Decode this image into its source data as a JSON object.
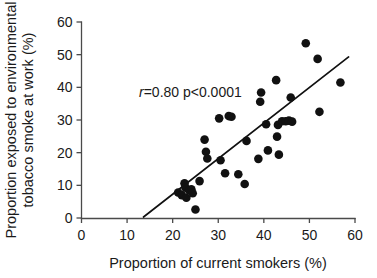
{
  "chart_data": {
    "type": "scatter",
    "title": "",
    "xlabel": "Proportion of current smokers (%)",
    "ylabel_line1": "Proportion exposed to environmental",
    "ylabel_line2": "tobacco smoke at work (%)",
    "xlim": [
      0,
      60
    ],
    "ylim": [
      0,
      60
    ],
    "xticks": [
      0,
      10,
      20,
      30,
      40,
      50,
      60
    ],
    "yticks": [
      0,
      10,
      20,
      30,
      40,
      50,
      60
    ],
    "xtick_labels": [
      "0",
      "10",
      "20",
      "30",
      "40",
      "50",
      "60"
    ],
    "ytick_labels": [
      "0",
      "10",
      "20",
      "30",
      "40",
      "50",
      "60"
    ],
    "grid": false,
    "legend": "none",
    "marker": "filled-circle",
    "marker_color": "#111111",
    "annotation": {
      "statistic_symbol": "r",
      "statistic_text": "=0.80 p<0.0001",
      "full_text": "r=0.80 p<0.0001",
      "x": 22.5,
      "y": 41.5
    },
    "fit_line": {
      "type": "linear-regression",
      "x_start": 13.6,
      "y_start": 0.3,
      "x_end": 58.6,
      "y_end": 49.3,
      "color": "#111111"
    },
    "points": [
      {
        "x": 21.2,
        "y": 7.8
      },
      {
        "x": 22.0,
        "y": 7.0
      },
      {
        "x": 22.6,
        "y": 10.6
      },
      {
        "x": 22.8,
        "y": 9.3
      },
      {
        "x": 23.0,
        "y": 6.2
      },
      {
        "x": 23.6,
        "y": 8.5
      },
      {
        "x": 24.1,
        "y": 8.8
      },
      {
        "x": 24.4,
        "y": 7.6
      },
      {
        "x": 25.0,
        "y": 2.6
      },
      {
        "x": 25.9,
        "y": 11.3
      },
      {
        "x": 27.0,
        "y": 24.0
      },
      {
        "x": 27.3,
        "y": 20.3
      },
      {
        "x": 27.6,
        "y": 18.2
      },
      {
        "x": 30.2,
        "y": 30.5
      },
      {
        "x": 30.5,
        "y": 17.7
      },
      {
        "x": 31.5,
        "y": 13.7
      },
      {
        "x": 32.3,
        "y": 31.2
      },
      {
        "x": 32.9,
        "y": 31.0
      },
      {
        "x": 34.4,
        "y": 13.4
      },
      {
        "x": 35.8,
        "y": 10.4
      },
      {
        "x": 36.2,
        "y": 23.6
      },
      {
        "x": 38.8,
        "y": 18.1
      },
      {
        "x": 39.2,
        "y": 35.6
      },
      {
        "x": 39.4,
        "y": 38.4
      },
      {
        "x": 40.5,
        "y": 28.7
      },
      {
        "x": 40.9,
        "y": 20.7
      },
      {
        "x": 42.7,
        "y": 42.2
      },
      {
        "x": 42.9,
        "y": 24.9
      },
      {
        "x": 43.1,
        "y": 28.5
      },
      {
        "x": 43.3,
        "y": 19.4
      },
      {
        "x": 44.0,
        "y": 29.6
      },
      {
        "x": 44.8,
        "y": 29.6
      },
      {
        "x": 45.5,
        "y": 29.8
      },
      {
        "x": 45.9,
        "y": 36.9
      },
      {
        "x": 46.2,
        "y": 29.5
      },
      {
        "x": 49.2,
        "y": 53.5
      },
      {
        "x": 51.8,
        "y": 48.7
      },
      {
        "x": 52.2,
        "y": 32.5
      },
      {
        "x": 56.8,
        "y": 41.5
      }
    ]
  }
}
